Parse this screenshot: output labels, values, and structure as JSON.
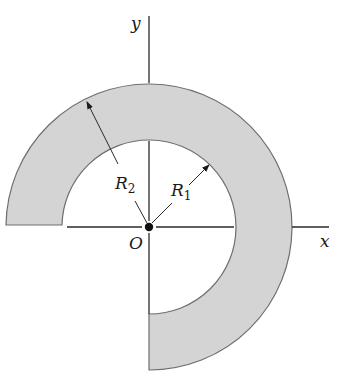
{
  "diagram": {
    "colors": {
      "ring_fill": "#d4d4d4",
      "ring_stroke": "#6e6e6e",
      "axis": "#2a2a2a",
      "text": "#1a1a1a"
    },
    "labels": {
      "x_axis": "x",
      "y_axis": "y",
      "origin": "O",
      "inner_radius": {
        "base": "R",
        "sub": "1"
      },
      "outer_radius": {
        "base": "R",
        "sub": "2"
      }
    },
    "geometry": {
      "center": [
        149,
        227
      ],
      "inner_radius_px": 87,
      "outer_radius_px": 143,
      "start_angle_deg": 180,
      "end_angle_deg": 270,
      "sweep": "clockwise through top and right"
    }
  }
}
